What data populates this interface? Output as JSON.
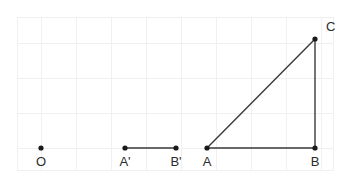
{
  "figure": {
    "canvas": {
      "width": 349,
      "height": 185,
      "background": "#ffffff"
    },
    "grid": {
      "visible": true,
      "color": "#f0f0f2",
      "frame_color": "#f4f4f6",
      "x_lines": [
        17,
        41,
        76,
        111,
        146,
        181,
        216,
        251,
        286,
        321,
        333
      ],
      "y_lines": [
        17,
        43,
        78,
        113,
        148,
        170
      ],
      "frame": {
        "x": 17,
        "y": 17,
        "width": 316,
        "height": 153
      }
    },
    "points": [
      {
        "name": "O",
        "label": "O",
        "x": 41,
        "y": 148,
        "label_x": 41,
        "label_y": 166,
        "dot": true
      },
      {
        "name": "A'",
        "label": "A'",
        "x": 125,
        "y": 148,
        "label_x": 125,
        "label_y": 166,
        "dot": true
      },
      {
        "name": "B'",
        "label": "B'",
        "x": 176,
        "y": 148,
        "label_x": 176,
        "label_y": 166,
        "dot": true
      },
      {
        "name": "A",
        "label": "A",
        "x": 207,
        "y": 148,
        "label_x": 207,
        "label_y": 166,
        "dot": true
      },
      {
        "name": "B",
        "label": "B",
        "x": 315,
        "y": 148,
        "label_x": 315,
        "label_y": 166,
        "dot": true
      },
      {
        "name": "C",
        "label": "C",
        "x": 315,
        "y": 39,
        "label_x": 326,
        "label_y": 31,
        "dot": true
      }
    ],
    "segments": [
      {
        "name": "segment-a-prime-b-prime",
        "x1": 125,
        "y1": 148,
        "x2": 176,
        "y2": 148
      },
      {
        "name": "segment-ab",
        "x1": 207,
        "y1": 148,
        "x2": 315,
        "y2": 148
      },
      {
        "name": "segment-bc",
        "x1": 315,
        "y1": 148,
        "x2": 315,
        "y2": 39
      },
      {
        "name": "segment-ca",
        "x1": 315,
        "y1": 39,
        "x2": 207,
        "y2": 148
      }
    ],
    "style": {
      "stroke_color": "#3a3a3a",
      "dot_color": "#1a1a1a",
      "label_color": "#2b2b2b",
      "dot_radius": 2.6,
      "stroke_width": 1.4,
      "label_font_size": 13
    }
  }
}
